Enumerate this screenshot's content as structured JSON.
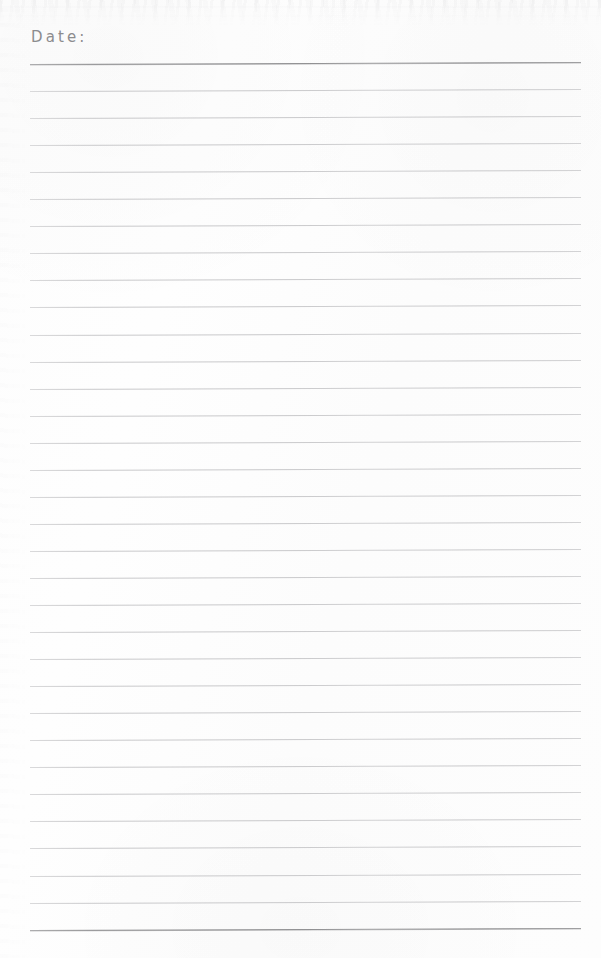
{
  "page": {
    "width": 601,
    "height": 958,
    "background_color": "#fdfdfd",
    "type": "lined-notebook-page"
  },
  "header": {
    "date_label": "Date:",
    "date_value": "",
    "label_color": "#8c8c8e"
  },
  "rules": {
    "count": 33,
    "first_line_y": 64,
    "spacing": 27.05,
    "left_x": 30,
    "right_x": 581,
    "normal_color": "#c9c9cb",
    "accent_color": "#8b8b8d",
    "emphasized_indices": [
      0,
      32
    ]
  }
}
